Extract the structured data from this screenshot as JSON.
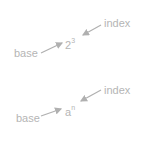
{
  "colors": {
    "text": "#b5b5b5",
    "arrow": "#b0b0b0",
    "background": "#ffffff"
  },
  "diagrams": [
    {
      "base_label": "base",
      "index_label": "index",
      "expression": {
        "base": "2",
        "index": "3"
      }
    },
    {
      "base_label": "base",
      "index_label": "index",
      "expression": {
        "base": "a",
        "index": "n"
      }
    }
  ]
}
